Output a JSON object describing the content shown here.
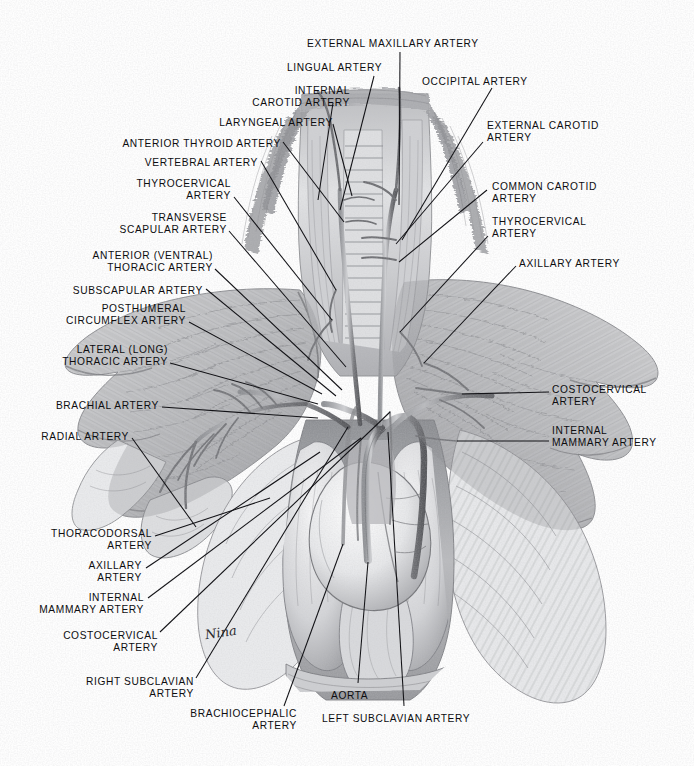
{
  "plate": {
    "title": "Arteries of the Thorax, Neck and Forelimb",
    "background_color": "#fefefe",
    "ink_color": "#0d0d10",
    "leader_color": "#121216",
    "width": 694,
    "height": 766
  },
  "signature": {
    "text": "Nina",
    "x": 205,
    "y": 625
  },
  "labels": [
    {
      "id": "external-maxillary-artery",
      "text": "EXTERNAL MAXILLARY ARTERY",
      "align": "l",
      "x": 307,
      "y": 38,
      "lines": [
        "EXTERNAL MAXILLARY ARTERY"
      ],
      "leader": {
        "x1": 400,
        "y1": 52,
        "x2": 399,
        "y2": 205
      }
    },
    {
      "id": "lingual-artery",
      "text": "LINGUAL ARTERY",
      "align": "l",
      "x": 287,
      "y": 62,
      "lines": [
        "LINGUAL ARTERY"
      ],
      "leader": {
        "x1": 374,
        "y1": 76,
        "x2": 340,
        "y2": 210
      }
    },
    {
      "id": "internal-carotid-artery",
      "text": "INTERNAL CAROTID ARTERY",
      "align": "r",
      "x": 350,
      "y": 85,
      "lines": [
        "INTERNAL",
        "CAROTID ARTERY"
      ],
      "leader": {
        "x1": 333,
        "y1": 103,
        "x2": 318,
        "y2": 200
      }
    },
    {
      "id": "occipital-artery",
      "text": "OCCIPITAL ARTERY",
      "align": "l",
      "x": 422,
      "y": 76,
      "lines": [
        "OCCIPITAL ARTERY"
      ],
      "leader": {
        "x1": 492,
        "y1": 88,
        "x2": 402,
        "y2": 240
      }
    },
    {
      "id": "laryngeal-artery",
      "text": "LARYNGEAL ARTERY",
      "align": "r",
      "x": 333,
      "y": 117,
      "lines": [
        "LARYNGEAL ARTERY"
      ],
      "leader": {
        "x1": 333,
        "y1": 124,
        "x2": 352,
        "y2": 196
      }
    },
    {
      "id": "external-carotid-artery",
      "text": "EXTERNAL CAROTID ARTERY",
      "align": "l",
      "x": 487,
      "y": 120,
      "lines": [
        "EXTERNAL CAROTID",
        "ARTERY"
      ],
      "leader": {
        "x1": 483,
        "y1": 142,
        "x2": 396,
        "y2": 244
      }
    },
    {
      "id": "anterior-thyroid-artery",
      "text": "ANTERIOR THYROID ARTERY",
      "align": "r",
      "x": 281,
      "y": 138,
      "lines": [
        "ANTERIOR THYROID ARTERY"
      ],
      "leader": {
        "x1": 283,
        "y1": 142,
        "x2": 344,
        "y2": 222
      }
    },
    {
      "id": "vertebral-artery",
      "text": "VERTEBRAL ARTERY",
      "align": "r",
      "x": 258,
      "y": 157,
      "lines": [
        "VERTEBRAL ARTERY"
      ],
      "leader": {
        "x1": 261,
        "y1": 161,
        "x2": 336,
        "y2": 290
      }
    },
    {
      "id": "thyrocervical-artery-left",
      "text": "THYROCERVICAL ARTERY",
      "align": "r",
      "x": 231,
      "y": 178,
      "lines": [
        "THYROCERVICAL",
        "ARTERY"
      ],
      "leader": {
        "x1": 234,
        "y1": 197,
        "x2": 332,
        "y2": 320
      }
    },
    {
      "id": "common-carotid-artery",
      "text": "COMMON CAROTID ARTERY",
      "align": "l",
      "x": 492,
      "y": 181,
      "lines": [
        "COMMON CAROTID",
        "ARTERY"
      ],
      "leader": {
        "x1": 487,
        "y1": 190,
        "x2": 399,
        "y2": 262
      }
    },
    {
      "id": "transverse-scapular-artery",
      "text": "TRANSVERSE SCAPULAR ARTERY",
      "align": "r",
      "x": 227,
      "y": 212,
      "lines": [
        "TRANSVERSE",
        "SCAPULAR ARTERY"
      ],
      "leader": {
        "x1": 229,
        "y1": 231,
        "x2": 346,
        "y2": 367
      }
    },
    {
      "id": "thyrocervical-artery-right",
      "text": "THYROCERVICAL ARTERY",
      "align": "l",
      "x": 492,
      "y": 216,
      "lines": [
        "THYROCERVICAL",
        "ARTERY"
      ],
      "leader": {
        "x1": 488,
        "y1": 236,
        "x2": 400,
        "y2": 332
      }
    },
    {
      "id": "anterior-ventral-thoracic-artery",
      "text": "ANTERIOR (VENTRAL) THORACIC ARTERY",
      "align": "r",
      "x": 213,
      "y": 250,
      "lines": [
        "ANTERIOR (VENTRAL)",
        "THORACIC ARTERY"
      ],
      "leader": {
        "x1": 215,
        "y1": 269,
        "x2": 342,
        "y2": 390
      }
    },
    {
      "id": "axillary-artery-right",
      "text": "AXILLARY ARTERY",
      "align": "l",
      "x": 519,
      "y": 258,
      "lines": [
        "AXILLARY ARTERY"
      ],
      "leader": {
        "x1": 516,
        "y1": 266,
        "x2": 424,
        "y2": 363
      }
    },
    {
      "id": "subscapular-artery",
      "text": "SUBSCAPULAR ARTERY",
      "align": "r",
      "x": 203,
      "y": 285,
      "lines": [
        "SUBSCAPULAR ARTERY"
      ],
      "leader": {
        "x1": 206,
        "y1": 289,
        "x2": 336,
        "y2": 396
      }
    },
    {
      "id": "posthumeral-circumflex-artery",
      "text": "POSTHUMERAL CIRMCUMFLEX ARTERY",
      "align": "r",
      "x": 186,
      "y": 303,
      "lines": [
        "POSTHUMERAL",
        "CIRCUMFLEX ARTERY"
      ],
      "leader": {
        "x1": 189,
        "y1": 322,
        "x2": 322,
        "y2": 394
      }
    },
    {
      "id": "lateral-long-thoracic-artery",
      "text": "LATERAL (LONG) THORACIC ARTERY",
      "align": "r",
      "x": 168,
      "y": 344,
      "lines": [
        "LATERAL (LONG)",
        "THORACIC ARTERY"
      ],
      "leader": {
        "x1": 170,
        "y1": 363,
        "x2": 318,
        "y2": 404
      }
    },
    {
      "id": "costocervical-artery-right",
      "text": "COSTOCERVICAL ARTERY",
      "align": "l",
      "x": 552,
      "y": 384,
      "lines": [
        "COSTOCERVICAL",
        "ARTERY"
      ],
      "leader": {
        "x1": 549,
        "y1": 392,
        "x2": 462,
        "y2": 394
      }
    },
    {
      "id": "brachial-artery",
      "text": "BRACHIAL ARTERY",
      "align": "r",
      "x": 159,
      "y": 400,
      "lines": [
        "BRACHIAL ARTERY"
      ],
      "leader": {
        "x1": 162,
        "y1": 407,
        "x2": 318,
        "y2": 418
      }
    },
    {
      "id": "internal-mammary-artery-right",
      "text": "INTERNAL MAMMARY ARTERY",
      "align": "l",
      "x": 552,
      "y": 425,
      "lines": [
        "INTERNAL",
        "MAMMARY ARTERY"
      ],
      "leader": {
        "x1": 549,
        "y1": 441,
        "x2": 457,
        "y2": 441
      }
    },
    {
      "id": "radial-artery",
      "text": "RADIAL ARTERY",
      "align": "r",
      "x": 129,
      "y": 431,
      "lines": [
        "RADIAL ARTERY"
      ],
      "leader": {
        "x1": 132,
        "y1": 438,
        "x2": 196,
        "y2": 527
      }
    },
    {
      "id": "thoracodorsal-artery",
      "text": "THORACODORSAL ARTERY",
      "align": "r",
      "x": 152,
      "y": 528,
      "lines": [
        "THORACODORSAL",
        "ARTERY"
      ],
      "leader": {
        "x1": 155,
        "y1": 536,
        "x2": 270,
        "y2": 498
      }
    },
    {
      "id": "axillary-artery-left",
      "text": "AXILLARY ARTERY",
      "align": "r",
      "x": 142,
      "y": 560,
      "lines": [
        "AXILLARY",
        "ARTERY"
      ],
      "leader": {
        "x1": 146,
        "y1": 568,
        "x2": 320,
        "y2": 452
      }
    },
    {
      "id": "internal-mammary-artery-left",
      "text": "INTERNAL MAMMARY ARTERY",
      "align": "r",
      "x": 144,
      "y": 592,
      "lines": [
        "INTERNAL",
        "MAMMARY ARTERY"
      ],
      "leader": {
        "x1": 148,
        "y1": 598,
        "x2": 361,
        "y2": 438
      }
    },
    {
      "id": "costocervical-artery-left",
      "text": "COSTOCERVICAL ARTERY",
      "align": "r",
      "x": 158,
      "y": 630,
      "lines": [
        "COSTOCERVICAL",
        "ARTERY"
      ],
      "leader": {
        "x1": 160,
        "y1": 632,
        "x2": 390,
        "y2": 412
      }
    },
    {
      "id": "right-subclavian-artery",
      "text": "RIGHT SUBCLAVIAN ARTERY",
      "align": "r",
      "x": 194,
      "y": 676,
      "lines": [
        "RIGHT SUBCLAVIAN",
        "ARTERY"
      ],
      "leader": {
        "x1": 196,
        "y1": 678,
        "x2": 348,
        "y2": 427
      }
    },
    {
      "id": "brachiocephalic-artery",
      "text": "BRACHIOCEPHALIC ARTERY",
      "align": "r",
      "x": 297,
      "y": 708,
      "lines": [
        "BRACHIOCEPHALIC",
        "ARTERY"
      ],
      "leader": {
        "x1": 284,
        "y1": 706,
        "x2": 343,
        "y2": 544
      }
    },
    {
      "id": "aorta",
      "text": "AORTA",
      "align": "l",
      "x": 331,
      "y": 690,
      "lines": [
        "AORTA"
      ],
      "leader": {
        "x1": 358,
        "y1": 683,
        "x2": 368,
        "y2": 562
      }
    },
    {
      "id": "left-subclavian-artery",
      "text": "LEFT SUBCLAVIAN ARTERY",
      "align": "l",
      "x": 322,
      "y": 713,
      "lines": [
        "LEFT SUBCLAVIAN ARTERY"
      ],
      "leader": {
        "x1": 404,
        "y1": 706,
        "x2": 388,
        "y2": 432
      }
    }
  ]
}
